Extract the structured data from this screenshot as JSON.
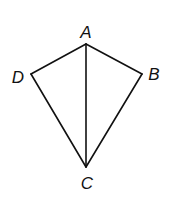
{
  "diagram": {
    "type": "kite",
    "stroke_color": "#111111",
    "background": "#ffffff",
    "vertices": [
      {
        "name": "A",
        "x": 86,
        "y": 44,
        "label": "A",
        "label_x": 86,
        "label_y": 38
      },
      {
        "name": "B",
        "x": 142,
        "y": 74,
        "label": "B",
        "label_x": 154,
        "label_y": 80
      },
      {
        "name": "C",
        "x": 86,
        "y": 167,
        "label": "C",
        "label_x": 87,
        "label_y": 189
      },
      {
        "name": "D",
        "x": 31,
        "y": 74,
        "label": "D",
        "label_x": 18,
        "label_y": 83
      }
    ],
    "segments": [
      {
        "name": "AB",
        "from": "A",
        "to": "B"
      },
      {
        "name": "BC",
        "from": "B",
        "to": "C"
      },
      {
        "name": "CD",
        "from": "C",
        "to": "D"
      },
      {
        "name": "DA",
        "from": "D",
        "to": "A"
      },
      {
        "name": "AC",
        "from": "A",
        "to": "C"
      }
    ]
  }
}
